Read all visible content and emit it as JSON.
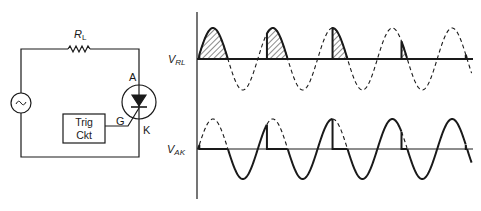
{
  "circuit": {
    "load_label": "R",
    "load_sub": "L",
    "scr_anode_label": "A",
    "scr_cathode_label": "K",
    "scr_gate_label": "G",
    "trigger_line1": "Trig",
    "trigger_line2": "Ckt",
    "source_icon": "ac-source-icon"
  },
  "graph": {
    "vrl_label": "V",
    "vrl_sub": "RL",
    "vak_label": "V",
    "vak_sub": "AK"
  },
  "chart_data": {
    "type": "line",
    "series": [
      {
        "name": "V_RL",
        "description": "Load voltage: conducts from firing angle to 180° each positive half-cycle (hatched), dashed = unused supply sine"
      },
      {
        "name": "V_AK",
        "description": "Anode-cathode voltage: follows supply until firing, then ~0 while conducting; negative half-cycles fully across SCR"
      }
    ],
    "cycles": 5,
    "firing_angles_deg": [
      8,
      55,
      90,
      145,
      172
    ],
    "colors": {
      "ink": "#1a1a1a",
      "background": "#ffffff"
    }
  }
}
